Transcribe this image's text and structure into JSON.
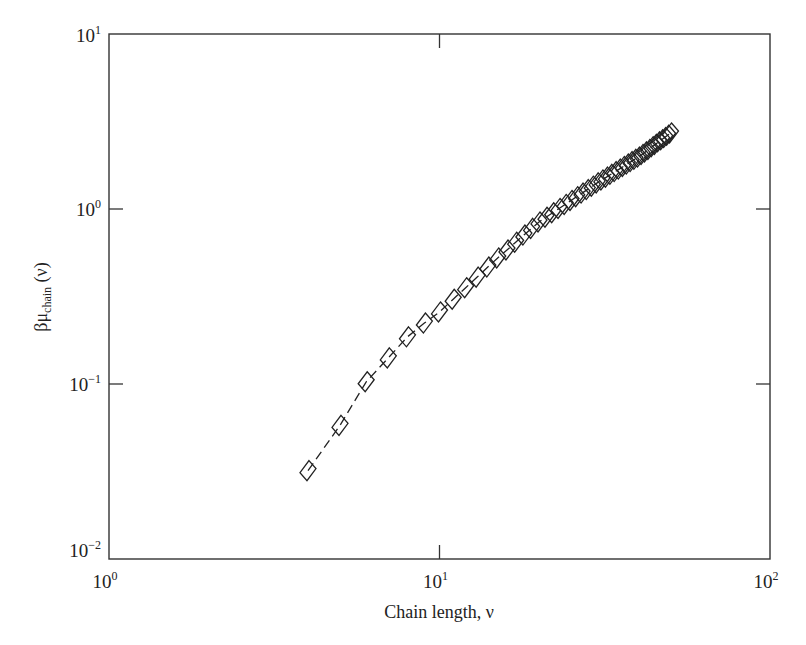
{
  "chart_data": {
    "type": "line",
    "title": "",
    "xlabel": "Chain length, ν",
    "ylabel": "βμchain (ν)",
    "ylabel_parts": {
      "main": "βμ",
      "subscript": "chain",
      "suffix": " (ν)"
    },
    "xscale": "log",
    "yscale": "log",
    "xlim": [
      1,
      100
    ],
    "ylim": [
      0.01,
      10
    ],
    "grid": false,
    "legend": null,
    "x_ticks": [
      {
        "value": 1,
        "base": "10",
        "exp": "0"
      },
      {
        "value": 10,
        "base": "10",
        "exp": "1"
      },
      {
        "value": 100,
        "base": "10",
        "exp": "2"
      }
    ],
    "y_ticks": [
      {
        "value": 0.01,
        "base": "10",
        "exp": "−2"
      },
      {
        "value": 0.1,
        "base": "10",
        "exp": "−1"
      },
      {
        "value": 1,
        "base": "10",
        "exp": "0"
      },
      {
        "value": 10,
        "base": "10",
        "exp": "1"
      }
    ],
    "series": [
      {
        "name": "βμchain",
        "marker": "diamond",
        "line_style": "dashed",
        "color": "#222222",
        "x": [
          4,
          5,
          6,
          7,
          8,
          9,
          10,
          11,
          12,
          13,
          14,
          15,
          16,
          17,
          18,
          19,
          20,
          21,
          22,
          23,
          24,
          25,
          26,
          27,
          28,
          29,
          30,
          31,
          32,
          33,
          34,
          35,
          36,
          37,
          38,
          39,
          40,
          41,
          42,
          43,
          44,
          45,
          46,
          47,
          48,
          49,
          50
        ],
        "values": [
          0.032,
          0.058,
          0.103,
          0.141,
          0.186,
          0.223,
          0.258,
          0.305,
          0.355,
          0.408,
          0.466,
          0.525,
          0.583,
          0.646,
          0.71,
          0.775,
          0.843,
          0.897,
          0.952,
          1.007,
          1.062,
          1.119,
          1.176,
          1.233,
          1.291,
          1.35,
          1.41,
          1.466,
          1.521,
          1.578,
          1.636,
          1.691,
          1.75,
          1.807,
          1.866,
          1.923,
          1.98,
          2.05,
          2.12,
          2.19,
          2.27,
          2.34,
          2.42,
          2.49,
          2.56,
          2.64,
          2.72
        ]
      }
    ]
  },
  "colors": {
    "axis": "#333333",
    "marker": "#222222",
    "background": "#ffffff"
  }
}
